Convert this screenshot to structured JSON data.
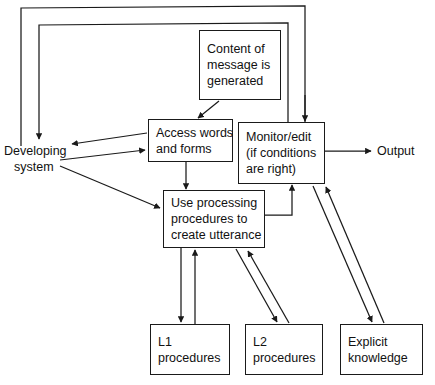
{
  "diagram": {
    "nodes": [
      {
        "id": "content-of-message",
        "name": "content-of-message-box",
        "shape": "box",
        "lines": [
          "Content of",
          "message is",
          "generated"
        ]
      },
      {
        "id": "access-words",
        "name": "access-words-and-forms-box",
        "shape": "box",
        "lines": [
          "Access words",
          "and forms"
        ]
      },
      {
        "id": "monitor-edit",
        "name": "monitor-edit-box",
        "shape": "box",
        "lines": [
          "Monitor/edit",
          "(if conditions",
          "are right)"
        ]
      },
      {
        "id": "developing-system",
        "name": "developing-system-label",
        "shape": "plain",
        "lines": [
          "Developing",
          "system"
        ]
      },
      {
        "id": "use-processing",
        "name": "use-processing-procedures-box",
        "shape": "box",
        "lines": [
          "Use processing",
          "procedures to",
          "create utterance"
        ]
      },
      {
        "id": "output",
        "name": "output-label",
        "shape": "plain",
        "lines": [
          "Output"
        ]
      },
      {
        "id": "l1-procedures",
        "name": "l1-procedures-box",
        "shape": "box",
        "lines": [
          "L1",
          "procedures"
        ]
      },
      {
        "id": "l2-procedures",
        "name": "l2-procedures-box",
        "shape": "box",
        "lines": [
          "L2",
          "procedures"
        ]
      },
      {
        "id": "explicit-knowledge",
        "name": "explicit-knowledge-box",
        "shape": "box",
        "lines": [
          "Explicit",
          "knowledge"
        ]
      }
    ],
    "edges": [
      {
        "from": "monitor-edit",
        "to": "developing-system",
        "style": "feedback-outer",
        "arrow": "none"
      },
      {
        "from": "monitor-edit",
        "to": "developing-system",
        "style": "feedback-inner",
        "arrow": "end"
      },
      {
        "from": "content-of-message",
        "to": "access-words",
        "style": "diagonal",
        "arrow": "end"
      },
      {
        "from": "access-words",
        "to": "developing-system",
        "style": "straight",
        "arrow": "end"
      },
      {
        "from": "developing-system",
        "to": "access-words",
        "style": "straight",
        "arrow": "end"
      },
      {
        "from": "developing-system",
        "to": "use-processing",
        "style": "diagonal",
        "arrow": "end"
      },
      {
        "from": "access-words",
        "to": "use-processing",
        "style": "vertical",
        "arrow": "end"
      },
      {
        "from": "use-processing",
        "to": "monitor-edit",
        "style": "elbow",
        "arrow": "end"
      },
      {
        "from": "monitor-edit",
        "to": "output",
        "style": "straight",
        "arrow": "end"
      },
      {
        "from": "use-processing",
        "to": "l1-procedures",
        "style": "vertical",
        "arrow": "end"
      },
      {
        "from": "l1-procedures",
        "to": "use-processing",
        "style": "vertical",
        "arrow": "end"
      },
      {
        "from": "use-processing",
        "to": "l2-procedures",
        "style": "diagonal",
        "arrow": "end"
      },
      {
        "from": "l2-procedures",
        "to": "use-processing",
        "style": "diagonal",
        "arrow": "end"
      },
      {
        "from": "monitor-edit",
        "to": "explicit-knowledge",
        "style": "diagonal",
        "arrow": "end"
      },
      {
        "from": "explicit-knowledge",
        "to": "monitor-edit",
        "style": "diagonal",
        "arrow": "end"
      }
    ],
    "colors": {
      "stroke": "#1a1a1a",
      "text": "#111111",
      "background": "#ffffff"
    }
  }
}
